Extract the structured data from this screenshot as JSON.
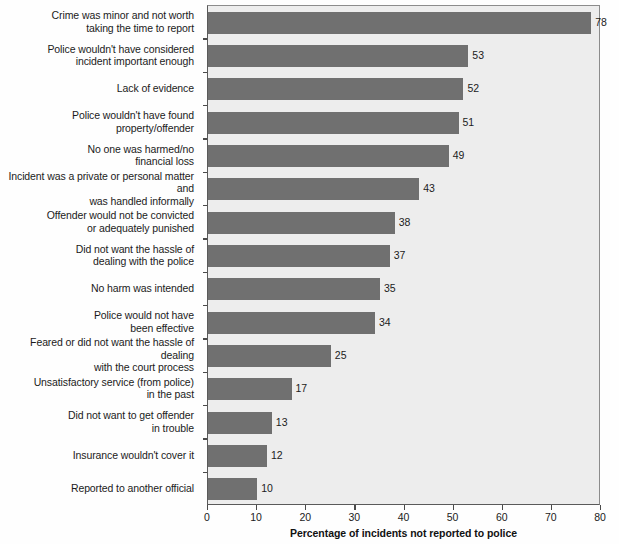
{
  "chart_data": {
    "type": "bar",
    "orientation": "horizontal",
    "title": "",
    "xlabel": "Percentage of incidents not reported to police",
    "ylabel": "",
    "xlim": [
      0,
      80
    ],
    "xticks": [
      0,
      10,
      20,
      30,
      40,
      50,
      60,
      70,
      80
    ],
    "grid": false,
    "legend": null,
    "bar_color": "#707070",
    "plot_background": "#ededed",
    "categories": [
      "Crime was minor and not worth taking the time to report",
      "Police wouldn't have considered incident important enough",
      "Lack of evidence",
      "Police wouldn't have found property/offender",
      "No one was harmed/no financial loss",
      "Incident was a private or personal matter and was handled informally",
      "Offender would not be convicted or adequately punished",
      "Did not want the hassle of dealing with the police",
      "No harm was intended",
      "Police would not have been effective",
      "Feared or did not want the hassle of dealing with the court process",
      "Unsatisfactory service (from police) in the past",
      "Did not want to get offender in trouble",
      "Insurance wouldn't cover it",
      "Reported to another official"
    ],
    "values": [
      78,
      53,
      52,
      51,
      49,
      43,
      38,
      37,
      35,
      34,
      25,
      17,
      13,
      12,
      10
    ]
  },
  "category_label_lines": [
    [
      "Crime was minor and not worth",
      "taking the time to report"
    ],
    [
      "Police wouldn't have considered",
      "incident important enough"
    ],
    [
      "Lack of evidence"
    ],
    [
      "Police wouldn't have found",
      "property/offender"
    ],
    [
      "No one was harmed/no",
      "financial loss"
    ],
    [
      "Incident was a private or personal matter and",
      "was handled informally"
    ],
    [
      "Offender would not be convicted",
      "or adequately punished"
    ],
    [
      "Did not want the hassle of",
      "dealing with the police"
    ],
    [
      "No harm was intended"
    ],
    [
      "Police would not have",
      "been effective"
    ],
    [
      "Feared or did not want the hassle of dealing",
      "with the court process"
    ],
    [
      "Unsatisfactory service (from police)",
      "in the past"
    ],
    [
      "Did not want to get offender",
      "in trouble"
    ],
    [
      "Insurance wouldn't cover it"
    ],
    [
      "Reported to another official"
    ]
  ]
}
